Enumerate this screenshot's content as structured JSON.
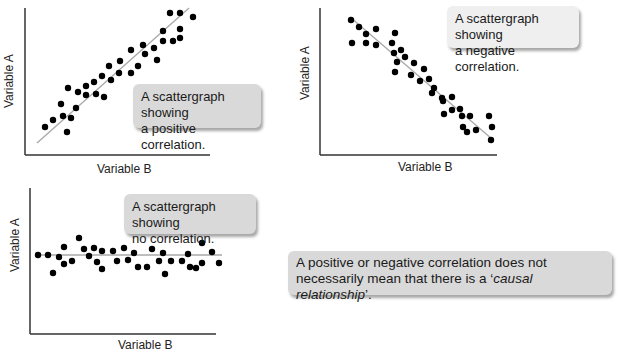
{
  "chart_data": [
    {
      "type": "scatter",
      "title": "A scattergraph showing a positive correlation.",
      "xlabel": "Variable B",
      "ylabel": "Variable A",
      "grid": false,
      "trendline": {
        "from": [
          12,
          12
        ],
        "to": [
          164,
          147
        ]
      },
      "points": [
        [
          20,
          28
        ],
        [
          28,
          35
        ],
        [
          36,
          51
        ],
        [
          38,
          39
        ],
        [
          42,
          23
        ],
        [
          43,
          67
        ],
        [
          46,
          37
        ],
        [
          51,
          47
        ],
        [
          53,
          63
        ],
        [
          61,
          69
        ],
        [
          61,
          60
        ],
        [
          69,
          73
        ],
        [
          71,
          61
        ],
        [
          77,
          79
        ],
        [
          79,
          58
        ],
        [
          84,
          89
        ],
        [
          86,
          75
        ],
        [
          94,
          82
        ],
        [
          95,
          94
        ],
        [
          106,
          82
        ],
        [
          106,
          105
        ],
        [
          113,
          89
        ],
        [
          118,
          110
        ],
        [
          120,
          101
        ],
        [
          129,
          107
        ],
        [
          132,
          95
        ],
        [
          138,
          114
        ],
        [
          138,
          124
        ],
        [
          148,
          114
        ],
        [
          155,
          142
        ],
        [
          155,
          126
        ],
        [
          155,
          117
        ],
        [
          145,
          142
        ],
        [
          168,
          138
        ]
      ]
    },
    {
      "type": "scatter",
      "title": "A scattergraph showing a negative correlation.",
      "xlabel": "Variable B",
      "ylabel": "Variable A",
      "grid": false,
      "trendline": {
        "from": [
          30,
          138
        ],
        "to": [
          172,
          16
        ]
      },
      "points": [
        [
          31,
          135
        ],
        [
          32,
          112
        ],
        [
          39,
          128
        ],
        [
          46,
          121
        ],
        [
          46,
          112
        ],
        [
          56,
          126
        ],
        [
          56,
          110
        ],
        [
          72,
          112
        ],
        [
          74,
          102
        ],
        [
          75,
          122
        ],
        [
          75,
          83
        ],
        [
          77,
          93
        ],
        [
          81,
          105
        ],
        [
          85,
          98
        ],
        [
          91,
          80
        ],
        [
          94,
          92
        ],
        [
          100,
          74
        ],
        [
          104,
          86
        ],
        [
          109,
          76
        ],
        [
          112,
          62
        ],
        [
          114,
          67
        ],
        [
          122,
          57
        ],
        [
          124,
          41
        ],
        [
          123,
          54
        ],
        [
          132,
          45
        ],
        [
          132,
          58
        ],
        [
          140,
          46
        ],
        [
          142,
          39
        ],
        [
          143,
          28
        ],
        [
          147,
          23
        ],
        [
          150,
          39
        ],
        [
          156,
          25
        ],
        [
          169,
          39
        ],
        [
          171,
          15
        ],
        [
          172,
          28
        ]
      ]
    },
    {
      "type": "scatter",
      "title": "A scattergraph showing no correlation.",
      "xlabel": "Variable B",
      "ylabel": "Variable A",
      "grid": false,
      "trendline": {
        "from": [
          6,
          79
        ],
        "to": [
          192,
          79
        ]
      },
      "points": [
        [
          8,
          79
        ],
        [
          18,
          79
        ],
        [
          23,
          61
        ],
        [
          29,
          77
        ],
        [
          34,
          87
        ],
        [
          34,
          70
        ],
        [
          42,
          73
        ],
        [
          49,
          96
        ],
        [
          54,
          85
        ],
        [
          59,
          78
        ],
        [
          64,
          86
        ],
        [
          67,
          72
        ],
        [
          72,
          83
        ],
        [
          72,
          65
        ],
        [
          83,
          83
        ],
        [
          87,
          73
        ],
        [
          94,
          86
        ],
        [
          98,
          74
        ],
        [
          104,
          81
        ],
        [
          108,
          67
        ],
        [
          117,
          67
        ],
        [
          122,
          85
        ],
        [
          129,
          73
        ],
        [
          133,
          81
        ],
        [
          135,
          60
        ],
        [
          141,
          73
        ],
        [
          152,
          73
        ],
        [
          158,
          80
        ],
        [
          160,
          67
        ],
        [
          166,
          66
        ],
        [
          172,
          91
        ],
        [
          172,
          71
        ],
        [
          182,
          82
        ],
        [
          189,
          71
        ]
      ]
    }
  ],
  "charts": [
    {
      "ylabel": "Variable A",
      "xlabel": "Variable B",
      "callout": {
        "line1": "A scattergraph showing",
        "line2": "a positive correlation."
      }
    },
    {
      "ylabel": "Variable A",
      "xlabel": "Variable B",
      "callout": {
        "line1": "A scattergraph showing",
        "line2": "a negative correlation."
      }
    },
    {
      "ylabel": "Variable A",
      "xlabel": "Variable B",
      "callout": {
        "line1": "A scattergraph showing",
        "line2": "no correlation."
      }
    }
  ],
  "note": {
    "line1": "A positive or negative correlation does not",
    "line2_pre": "necessarily mean that there is a ‘",
    "line2_italic": "causal relationship",
    "line2_post": "’."
  },
  "colors": {
    "axis": "#333333",
    "dot": "#000000",
    "trendline": "#a8a8a8",
    "callout_bg": "#d9d9d9"
  }
}
